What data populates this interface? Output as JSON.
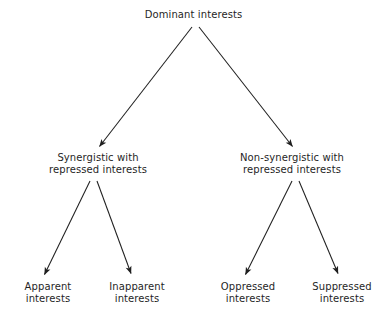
{
  "diagram": {
    "type": "tree",
    "title": "Dominant interests",
    "background_color": "#ffffff",
    "line_color": "#1f1f1f",
    "text_color": "#1f1f1f",
    "levels": 3,
    "root": {
      "id": "dominant-interests",
      "label": "Dominant interests"
    },
    "level2": [
      {
        "id": "synergistic",
        "line1": "Synergistic with",
        "line2": "repressed interests"
      },
      {
        "id": "non-synergistic",
        "line1": "Non-synergistic with",
        "line2": "repressed interests"
      }
    ],
    "level3": [
      {
        "id": "apparent",
        "line1": "Apparent",
        "line2": "interests"
      },
      {
        "id": "inapparent",
        "line1": "Inapparent",
        "line2": "interests"
      },
      {
        "id": "oppressed",
        "line1": "Oppressed",
        "line2": "interests"
      },
      {
        "id": "suppressed",
        "line1": "Suppressed",
        "line2": "interests"
      }
    ],
    "edges": [
      {
        "id": "edge-root-synergistic",
        "from": "dominant-interests",
        "to": "synergistic"
      },
      {
        "id": "edge-root-non-synergistic",
        "from": "dominant-interests",
        "to": "non-synergistic"
      },
      {
        "id": "edge-synergistic-apparent",
        "from": "synergistic",
        "to": "apparent"
      },
      {
        "id": "edge-synergistic-inapparent",
        "from": "synergistic",
        "to": "inapparent"
      },
      {
        "id": "edge-nonsyn-oppressed",
        "from": "non-synergistic",
        "to": "oppressed"
      },
      {
        "id": "edge-nonsyn-suppressed",
        "from": "non-synergistic",
        "to": "suppressed"
      }
    ]
  }
}
